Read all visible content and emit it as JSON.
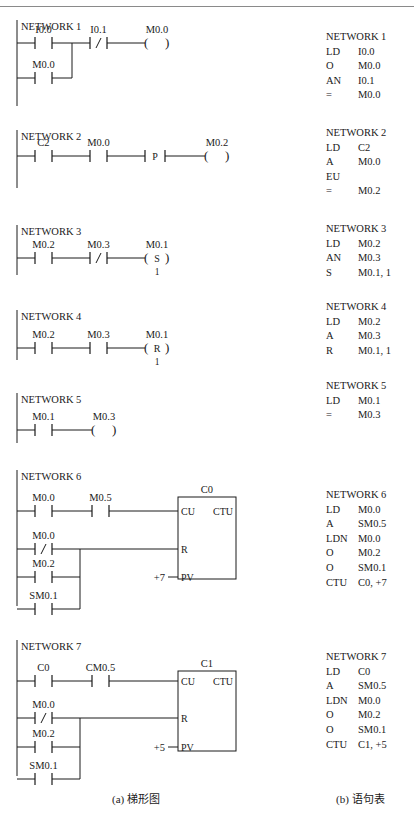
{
  "ladder": {
    "caption": "(a) 梯形图",
    "networks": [
      {
        "title": "NETWORK 1",
        "y": 20,
        "rail_h": 78,
        "elements": [
          {
            "type": "no",
            "label": "I0.0",
            "x": 35,
            "y": 43
          },
          {
            "type": "no",
            "label": "M0.0",
            "x": 35,
            "y": 78
          },
          {
            "type": "nc",
            "label": "I0.1",
            "x": 90,
            "y": 43
          },
          {
            "type": "coil",
            "label": "M0.0",
            "x": 145,
            "y": 43,
            "text": ""
          }
        ],
        "wires": [
          [
            17,
            43,
            35,
            43
          ],
          [
            52,
            43,
            90,
            43
          ],
          [
            107,
            43,
            145,
            43
          ],
          [
            17,
            78,
            35,
            78
          ],
          [
            52,
            78,
            72,
            78
          ],
          [
            72,
            43,
            72,
            78
          ]
        ]
      },
      {
        "title": "NETWORK 2",
        "y": 130,
        "rail_h": 50,
        "elements": [
          {
            "type": "no",
            "label": "C2",
            "x": 35,
            "y": 156
          },
          {
            "type": "no",
            "label": "M0.0",
            "x": 90,
            "y": 156
          },
          {
            "type": "pos",
            "label": "",
            "x": 145,
            "y": 156,
            "text": "P"
          },
          {
            "type": "coil",
            "label": "M0.2",
            "x": 205,
            "y": 156,
            "text": ""
          }
        ],
        "wires": [
          [
            17,
            156,
            35,
            156
          ],
          [
            52,
            156,
            90,
            156
          ],
          [
            107,
            156,
            145,
            156
          ],
          [
            165,
            156,
            205,
            156
          ]
        ]
      },
      {
        "title": "NETWORK 3",
        "y": 225,
        "rail_h": 42,
        "elements": [
          {
            "type": "no",
            "label": "M0.2",
            "x": 35,
            "y": 258
          },
          {
            "type": "nc",
            "label": "M0.3",
            "x": 90,
            "y": 258
          },
          {
            "type": "coil",
            "label": "M0.1",
            "x": 145,
            "y": 258,
            "text": "S",
            "sub": "1"
          }
        ],
        "wires": [
          [
            17,
            258,
            35,
            258
          ],
          [
            52,
            258,
            90,
            258
          ],
          [
            107,
            258,
            145,
            258
          ]
        ]
      },
      {
        "title": "NETWORK 4",
        "y": 310,
        "rail_h": 42,
        "elements": [
          {
            "type": "no",
            "label": "M0.2",
            "x": 35,
            "y": 348
          },
          {
            "type": "no",
            "label": "M0.3",
            "x": 90,
            "y": 348
          },
          {
            "type": "coil",
            "label": "M0.1",
            "x": 145,
            "y": 348,
            "text": "R",
            "sub": "1"
          }
        ],
        "wires": [
          [
            17,
            348,
            35,
            348
          ],
          [
            52,
            348,
            90,
            348
          ],
          [
            107,
            348,
            145,
            348
          ]
        ]
      },
      {
        "title": "NETWORK 5",
        "y": 393,
        "rail_h": 42,
        "elements": [
          {
            "type": "no",
            "label": "M0.1",
            "x": 35,
            "y": 430
          },
          {
            "type": "coil",
            "label": "M0.3",
            "x": 92,
            "y": 430,
            "text": ""
          }
        ],
        "wires": [
          [
            17,
            430,
            35,
            430
          ],
          [
            52,
            430,
            92,
            430
          ]
        ]
      },
      {
        "title": "NETWORK 6",
        "y": 470,
        "rail_h": 128,
        "elements": [
          {
            "type": "no",
            "label": "M0.0",
            "x": 35,
            "y": 511
          },
          {
            "type": "no",
            "label": "M0.5",
            "x": 92,
            "y": 511
          },
          {
            "type": "nc",
            "label": "M0.0",
            "x": 35,
            "y": 549
          },
          {
            "type": "no",
            "label": "M0.2",
            "x": 35,
            "y": 577
          },
          {
            "type": "no",
            "label": "SM0.1",
            "x": 35,
            "y": 609
          }
        ],
        "wires": [
          [
            17,
            511,
            35,
            511
          ],
          [
            52,
            511,
            92,
            511
          ],
          [
            109,
            511,
            178,
            511
          ],
          [
            17,
            549,
            35,
            549
          ],
          [
            52,
            549,
            178,
            549
          ],
          [
            17,
            577,
            35,
            577
          ],
          [
            52,
            577,
            80,
            577
          ],
          [
            17,
            609,
            35,
            609
          ],
          [
            52,
            609,
            80,
            609
          ],
          [
            80,
            549,
            80,
            609
          ],
          [
            168,
            577,
            178,
            577
          ]
        ],
        "counter": {
          "name": "C0",
          "x": 178,
          "y": 497,
          "w": 58,
          "h": 82,
          "cu": "CU",
          "type": "CTU",
          "r": "R",
          "pv": "PV",
          "pv_value": "+7",
          "cu_y": 511,
          "r_y": 549,
          "pv_y": 577
        }
      },
      {
        "title": "NETWORK 7",
        "y": 640,
        "rail_h": 128,
        "elements": [
          {
            "type": "no",
            "label": "C0",
            "x": 35,
            "y": 681
          },
          {
            "type": "no",
            "label": "CM0.5",
            "x": 92,
            "y": 681
          },
          {
            "type": "nc",
            "label": "M0.0",
            "x": 35,
            "y": 718
          },
          {
            "type": "no",
            "label": "M0.2",
            "x": 35,
            "y": 747
          },
          {
            "type": "no",
            "label": "SM0.1",
            "x": 35,
            "y": 779
          }
        ],
        "wires": [
          [
            17,
            681,
            35,
            681
          ],
          [
            52,
            681,
            92,
            681
          ],
          [
            109,
            681,
            178,
            681
          ],
          [
            17,
            718,
            35,
            718
          ],
          [
            52,
            718,
            178,
            718
          ],
          [
            17,
            747,
            35,
            747
          ],
          [
            52,
            747,
            80,
            747
          ],
          [
            17,
            779,
            35,
            779
          ],
          [
            52,
            779,
            80,
            779
          ],
          [
            80,
            718,
            80,
            779
          ],
          [
            168,
            747,
            178,
            747
          ]
        ],
        "counter": {
          "name": "C1",
          "x": 178,
          "y": 671,
          "w": 58,
          "h": 80,
          "cu": "CU",
          "type": "CTU",
          "r": "R",
          "pv": "PV",
          "pv_value": "+5",
          "cu_y": 681,
          "r_y": 718,
          "pv_y": 747
        }
      }
    ]
  },
  "statement_list": {
    "caption": "(b) 语句表",
    "networks": [
      {
        "title": "NETWORK 1",
        "top": 30,
        "rows": [
          {
            "op": "LD",
            "arg": "I0.0"
          },
          {
            "op": "O",
            "arg": "M0.0"
          },
          {
            "op": "AN",
            "arg": "I0.1"
          },
          {
            "op": "=",
            "arg": "M0.0"
          }
        ]
      },
      {
        "title": "NETWORK 2",
        "top": 126,
        "rows": [
          {
            "op": "LD",
            "arg": "C2"
          },
          {
            "op": "A",
            "arg": "M0.0"
          },
          {
            "op": "EU",
            "arg": ""
          },
          {
            "op": "=",
            "arg": "M0.2"
          }
        ]
      },
      {
        "title": "NETWORK 3",
        "top": 222,
        "rows": [
          {
            "op": "LD",
            "arg": "M0.2"
          },
          {
            "op": "AN",
            "arg": "M0.3"
          },
          {
            "op": "S",
            "arg": "M0.1, 1"
          }
        ]
      },
      {
        "title": "NETWORK 4",
        "top": 300,
        "rows": [
          {
            "op": "LD",
            "arg": "M0.2"
          },
          {
            "op": "A",
            "arg": "M0.3"
          },
          {
            "op": "R",
            "arg": "M0.1, 1"
          }
        ]
      },
      {
        "title": "NETWORK 5",
        "top": 379,
        "rows": [
          {
            "op": "LD",
            "arg": "M0.1"
          },
          {
            "op": "=",
            "arg": "M0.3"
          }
        ]
      },
      {
        "title": "NETWORK 6",
        "top": 488,
        "rows": [
          {
            "op": "LD",
            "arg": "M0.0"
          },
          {
            "op": "A",
            "arg": "SM0.5"
          },
          {
            "op": "LDN",
            "arg": "M0.0"
          },
          {
            "op": "O",
            "arg": "M0.2"
          },
          {
            "op": "O",
            "arg": "SM0.1"
          },
          {
            "op": "CTU",
            "arg": "C0, +7"
          }
        ]
      },
      {
        "title": "NETWORK 7",
        "top": 650,
        "rows": [
          {
            "op": "LD",
            "arg": "C0"
          },
          {
            "op": "A",
            "arg": "SM0.5"
          },
          {
            "op": "LDN",
            "arg": "M0.0"
          },
          {
            "op": "O",
            "arg": "M0.2"
          },
          {
            "op": "O",
            "arg": "SM0.1"
          },
          {
            "op": "CTU",
            "arg": "C1, +5"
          }
        ]
      }
    ]
  }
}
